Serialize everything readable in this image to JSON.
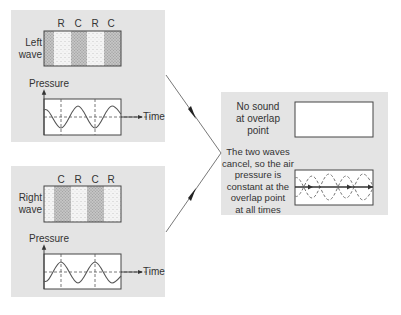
{
  "left_panel": {
    "wave_label_line1": "Left",
    "wave_label_line2": "wave",
    "band_letters": [
      "R",
      "C",
      "R",
      "C"
    ],
    "pressure_label": "Pressure",
    "time_label": "Time"
  },
  "right_panel": {
    "wave_label_line1": "Right",
    "wave_label_line2": "wave",
    "band_letters": [
      "C",
      "R",
      "C",
      "R"
    ],
    "pressure_label": "Pressure",
    "time_label": "Time"
  },
  "result_panel": {
    "no_sound_lines": [
      "No sound",
      "at overlap",
      "point"
    ],
    "explanation_lines": [
      "The two waves",
      "cancel, so the air",
      "pressure is",
      "constant at the",
      "overlap point",
      "at all times"
    ]
  },
  "colors": {
    "panel_bg": "#e4e4e4",
    "compression": "#b8b8b8",
    "rarefaction": "#f2f2f2",
    "line": "#555555"
  }
}
